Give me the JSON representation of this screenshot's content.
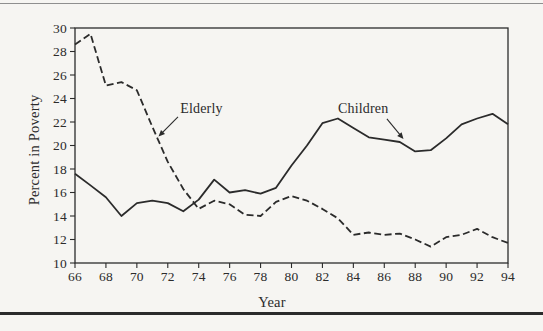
{
  "figure": {
    "ink_color": "#2b2b2b",
    "paper_color": "#f6f5f2",
    "top_rule_color": "#8f8f8f"
  },
  "chart_data": {
    "type": "line",
    "title": "",
    "xlabel": "Year",
    "ylabel": "Percent in Poverty",
    "xlim": [
      66,
      94
    ],
    "ylim": [
      10,
      30
    ],
    "grid": false,
    "legend": "inline annotations with arrows",
    "x_ticks": [
      66,
      68,
      70,
      72,
      74,
      76,
      78,
      80,
      82,
      84,
      86,
      88,
      90,
      92,
      94
    ],
    "y_ticks": [
      10,
      12,
      14,
      16,
      18,
      20,
      22,
      24,
      26,
      28,
      30
    ],
    "x": [
      66,
      67,
      68,
      69,
      70,
      71,
      72,
      73,
      74,
      75,
      76,
      77,
      78,
      79,
      80,
      81,
      82,
      83,
      84,
      85,
      86,
      87,
      88,
      89,
      90,
      91,
      92,
      93,
      94
    ],
    "series": [
      {
        "name": "Elderly",
        "style": "dashed",
        "values": [
          28.6,
          29.5,
          25.1,
          25.4,
          24.7,
          21.6,
          18.6,
          16.3,
          14.6,
          15.3,
          15.0,
          14.1,
          14.0,
          15.2,
          15.7,
          15.3,
          14.6,
          13.8,
          12.4,
          12.6,
          12.4,
          12.5,
          12.0,
          11.4,
          12.2,
          12.4,
          12.9,
          12.2,
          11.7
        ]
      },
      {
        "name": "Children",
        "style": "solid",
        "values": [
          17.6,
          16.6,
          15.6,
          14.0,
          15.1,
          15.3,
          15.1,
          14.4,
          15.4,
          17.1,
          16.0,
          16.2,
          15.9,
          16.4,
          18.3,
          20.0,
          21.9,
          22.3,
          21.5,
          20.7,
          20.5,
          20.3,
          19.5,
          19.6,
          20.6,
          21.8,
          22.3,
          22.7,
          21.8
        ]
      }
    ],
    "annotations": [
      {
        "label": "Elderly",
        "label_x": 72.8,
        "label_y": 22.8,
        "arrow": {
          "from_x": 72.66,
          "from_y": 22.43,
          "to_x": 71.4,
          "to_y": 20.77
        }
      },
      {
        "label": "Children",
        "label_x": 83.0,
        "label_y": 22.8,
        "arrow": {
          "from_x": 86.17,
          "from_y": 22.26,
          "to_x": 87.24,
          "to_y": 20.55
        }
      }
    ]
  }
}
